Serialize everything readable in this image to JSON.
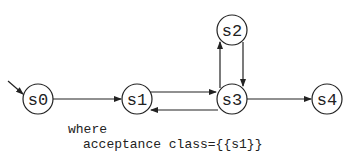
{
  "automaton": {
    "states": [
      {
        "id": "s0",
        "label": "s0",
        "x": 38,
        "y": 99,
        "initial": true
      },
      {
        "id": "s1",
        "label": "s1",
        "x": 137,
        "y": 99
      },
      {
        "id": "s2",
        "label": "s2",
        "x": 232,
        "y": 30
      },
      {
        "id": "s3",
        "label": "s3",
        "x": 232,
        "y": 99
      },
      {
        "id": "s4",
        "label": "s4",
        "x": 327,
        "y": 99
      }
    ],
    "transitions": [
      {
        "from": "s0",
        "to": "s1"
      },
      {
        "from": "s1",
        "to": "s3"
      },
      {
        "from": "s3",
        "to": "s1"
      },
      {
        "from": "s3",
        "to": "s2"
      },
      {
        "from": "s2",
        "to": "s3"
      },
      {
        "from": "s3",
        "to": "s4"
      }
    ]
  },
  "note": {
    "line1": "where",
    "line2": "acceptance class={{s1}}"
  }
}
